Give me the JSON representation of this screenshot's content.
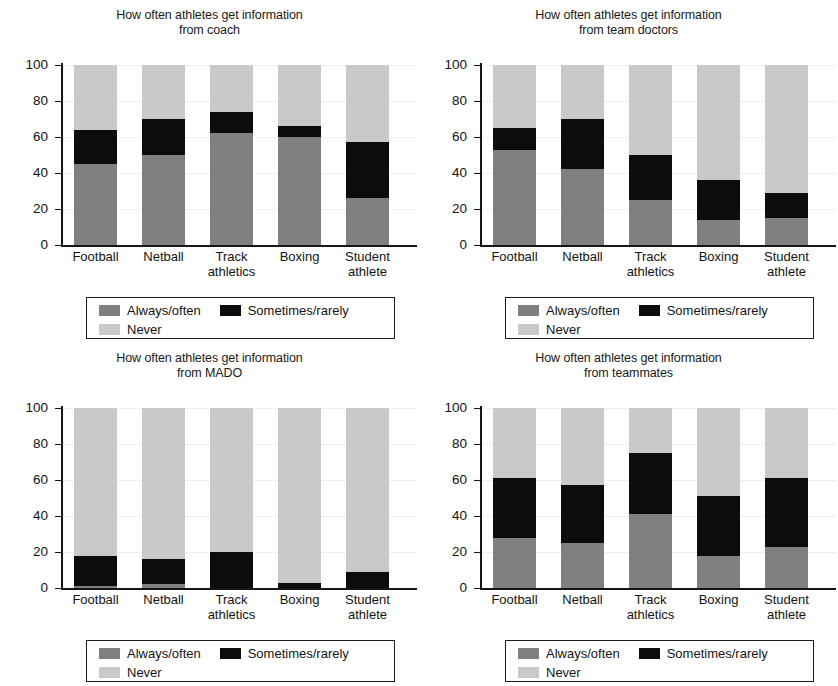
{
  "legend": {
    "items": [
      {
        "key": "always",
        "label": "Always/often",
        "color": "#808080"
      },
      {
        "key": "sometimes",
        "label": "Sometimes/rarely",
        "color": "#0c0c0c"
      },
      {
        "key": "never",
        "label": "Never",
        "color": "#c9c9c9"
      }
    ]
  },
  "axis": {
    "ticks": [
      "100",
      "80",
      "60",
      "40",
      "20",
      "0"
    ],
    "categories": [
      "Football",
      "Netball",
      "Track\nathletics",
      "Boxing",
      "Student\nathlete"
    ]
  },
  "chart_data": [
    {
      "type": "bar",
      "stacked": true,
      "title": "How often athletes get information\nfrom coach",
      "xlabel": "",
      "ylabel": "",
      "ylim": [
        0,
        100
      ],
      "grid": true,
      "legend_position": "bottom",
      "categories": [
        "Football",
        "Netball",
        "Track athletics",
        "Boxing",
        "Student athlete"
      ],
      "series": [
        {
          "name": "Always/often",
          "color": "#808080",
          "values": [
            45,
            50,
            62,
            60,
            26
          ]
        },
        {
          "name": "Sometimes/rarely",
          "color": "#0c0c0c",
          "values": [
            19,
            20,
            12,
            6,
            31
          ]
        },
        {
          "name": "Never",
          "color": "#c9c9c9",
          "values": [
            36,
            30,
            26,
            34,
            43
          ]
        }
      ]
    },
    {
      "type": "bar",
      "stacked": true,
      "title": "How often athletes get information\nfrom team doctors",
      "xlabel": "",
      "ylabel": "",
      "ylim": [
        0,
        100
      ],
      "grid": true,
      "legend_position": "bottom",
      "categories": [
        "Football",
        "Netball",
        "Track athletics",
        "Boxing",
        "Student athlete"
      ],
      "series": [
        {
          "name": "Always/often",
          "color": "#808080",
          "values": [
            53,
            42,
            25,
            14,
            15
          ]
        },
        {
          "name": "Sometimes/rarely",
          "color": "#0c0c0c",
          "values": [
            12,
            28,
            25,
            22,
            14
          ]
        },
        {
          "name": "Never",
          "color": "#c9c9c9",
          "values": [
            35,
            30,
            50,
            64,
            71
          ]
        }
      ]
    },
    {
      "type": "bar",
      "stacked": true,
      "title": "How often athletes get information\nfrom MADO",
      "xlabel": "",
      "ylabel": "",
      "ylim": [
        0,
        100
      ],
      "grid": true,
      "legend_position": "bottom",
      "categories": [
        "Football",
        "Netball",
        "Track athletics",
        "Boxing",
        "Student athlete"
      ],
      "series": [
        {
          "name": "Always/often",
          "color": "#808080",
          "values": [
            1,
            2,
            0,
            0,
            0
          ]
        },
        {
          "name": "Sometimes/rarely",
          "color": "#0c0c0c",
          "values": [
            17,
            14,
            20,
            3,
            9
          ]
        },
        {
          "name": "Never",
          "color": "#c9c9c9",
          "values": [
            82,
            84,
            80,
            97,
            91
          ]
        }
      ]
    },
    {
      "type": "bar",
      "stacked": true,
      "title": "How often athletes get information\nfrom teammates",
      "xlabel": "",
      "ylabel": "",
      "ylim": [
        0,
        100
      ],
      "grid": true,
      "legend_position": "bottom",
      "categories": [
        "Football",
        "Netball",
        "Track athletics",
        "Boxing",
        "Student athlete"
      ],
      "series": [
        {
          "name": "Always/often",
          "color": "#808080",
          "values": [
            28,
            25,
            41,
            18,
            23
          ]
        },
        {
          "name": "Sometimes/rarely",
          "color": "#0c0c0c",
          "values": [
            33,
            32,
            34,
            33,
            38
          ]
        },
        {
          "name": "Never",
          "color": "#c9c9c9",
          "values": [
            39,
            43,
            25,
            49,
            39
          ]
        }
      ]
    }
  ]
}
